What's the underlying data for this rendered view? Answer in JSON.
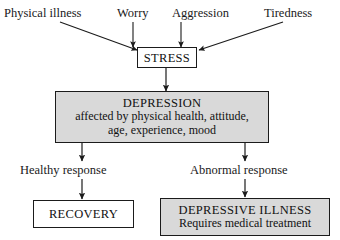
{
  "diagram": {
    "colors": {
      "stroke": "#1b1b1b",
      "box_fill_plain": "#ffffff",
      "box_fill_shaded": "#d9d9d9",
      "text": "#1a1a1a",
      "background": "#ffffff"
    },
    "inputs": [
      {
        "id": "physical-illness",
        "label": "Physical illness"
      },
      {
        "id": "worry",
        "label": "Worry"
      },
      {
        "id": "aggression",
        "label": "Aggression"
      },
      {
        "id": "tiredness",
        "label": "Tiredness"
      }
    ],
    "nodes": {
      "stress": {
        "title": "STRESS",
        "fill": "plain"
      },
      "depression": {
        "title": "DEPRESSION",
        "line2": "affected by physical health, attitude,",
        "line3": "age, experience, mood",
        "fill": "shaded"
      },
      "recovery": {
        "title": "RECOVERY",
        "fill": "plain"
      },
      "depressive_illness": {
        "title": "DEPRESSIVE ILLNESS",
        "line2": "Requires medical treatment",
        "fill": "shaded"
      }
    },
    "branch_labels": [
      {
        "id": "healthy-response",
        "label": "Healthy response"
      },
      {
        "id": "abnormal-response",
        "label": "Abnormal response"
      }
    ],
    "connectors": [
      {
        "id": "physical-illness-to-stress",
        "kind": "diagonal-arrow"
      },
      {
        "id": "worry-to-stress",
        "kind": "vertical-arrow"
      },
      {
        "id": "aggression-to-stress",
        "kind": "vertical-arrow"
      },
      {
        "id": "tiredness-to-stress",
        "kind": "diagonal-arrow"
      },
      {
        "id": "stress-to-depression",
        "kind": "vertical-arrow"
      },
      {
        "id": "depression-to-healthy",
        "kind": "vertical-arrow"
      },
      {
        "id": "depression-to-abnormal",
        "kind": "vertical-arrow"
      },
      {
        "id": "healthy-to-recovery",
        "kind": "vertical-arrow"
      },
      {
        "id": "abnormal-to-depressive",
        "kind": "vertical-arrow"
      }
    ]
  }
}
